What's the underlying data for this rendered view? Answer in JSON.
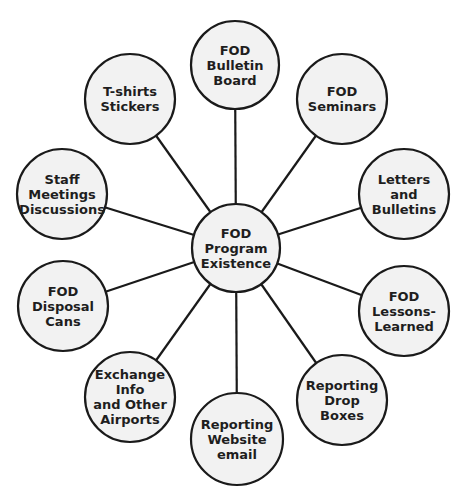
{
  "diagram": {
    "type": "hub-and-spoke",
    "colors": {
      "node_fill": "#f2f2f2",
      "stroke": "#1a1a1a",
      "text": "#1e1e1e",
      "background": "#ffffff"
    },
    "center": {
      "id": "center",
      "lines": [
        "FOD",
        "Program",
        "Existence"
      ],
      "cx": 236,
      "cy": 248,
      "r": 44
    },
    "nodes": [
      {
        "id": "bulletin-board",
        "lines": [
          "FOD",
          "Bulletin",
          "Board"
        ],
        "cx": 235,
        "cy": 65,
        "r": 44
      },
      {
        "id": "seminars",
        "lines": [
          "FOD",
          "Seminars"
        ],
        "cx": 342,
        "cy": 99,
        "r": 45
      },
      {
        "id": "letters-bulletins",
        "lines": [
          "Letters",
          "and",
          "Bulletins"
        ],
        "cx": 404,
        "cy": 194,
        "r": 45
      },
      {
        "id": "lessons-learned",
        "lines": [
          "FOD",
          "Lessons-",
          "Learned"
        ],
        "cx": 404,
        "cy": 311,
        "r": 45
      },
      {
        "id": "reporting-drop-boxes",
        "lines": [
          "Reporting",
          "Drop",
          "Boxes"
        ],
        "cx": 342,
        "cy": 400,
        "r": 45
      },
      {
        "id": "reporting-website-email",
        "lines": [
          "Reporting",
          "Website",
          "email"
        ],
        "cx": 237,
        "cy": 439,
        "r": 46
      },
      {
        "id": "exchange-info",
        "lines": [
          "Exchange",
          "Info",
          "and Other",
          "Airports"
        ],
        "cx": 130,
        "cy": 397,
        "r": 45
      },
      {
        "id": "disposal-cans",
        "lines": [
          "FOD",
          "Disposal",
          "Cans"
        ],
        "cx": 63,
        "cy": 306,
        "r": 45
      },
      {
        "id": "staff-meetings",
        "lines": [
          "Staff",
          "Meetings",
          "Discussions"
        ],
        "cx": 62,
        "cy": 194,
        "r": 45
      },
      {
        "id": "tshirts-stickers",
        "lines": [
          "T-shirts",
          "Stickers"
        ],
        "cx": 130,
        "cy": 99,
        "r": 45
      }
    ]
  }
}
